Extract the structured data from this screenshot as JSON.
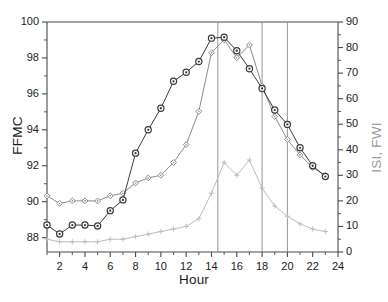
{
  "chart_data": {
    "type": "line",
    "title": "",
    "xlabel": "Hour",
    "ylabel": "FFMC",
    "ylabel_right": "ISI, FWI",
    "xlim": [
      1,
      24
    ],
    "ylim": [
      87.2,
      100
    ],
    "ylim_right": [
      0,
      90
    ],
    "grid": false,
    "legend_position": "none",
    "xticks": [
      2,
      4,
      6,
      8,
      10,
      12,
      14,
      16,
      18,
      20,
      22,
      24
    ],
    "xticks_minor": [
      1,
      3,
      5,
      7,
      9,
      11,
      13,
      15,
      17,
      19,
      21,
      23
    ],
    "yticks_left": [
      88,
      90,
      92,
      94,
      96,
      98,
      100
    ],
    "yticks_right": [
      0,
      10,
      20,
      30,
      40,
      50,
      60,
      70,
      80,
      90
    ],
    "vertical_reference_lines": [
      14.5,
      18,
      20
    ],
    "x": [
      1,
      2,
      3,
      4,
      5,
      6,
      7,
      8,
      9,
      10,
      11,
      12,
      13,
      14,
      15,
      16,
      17,
      18,
      19,
      20,
      21,
      22,
      23
    ],
    "series": [
      {
        "name": "FFMC",
        "axis": "left",
        "color": "#3a3a3a",
        "marker": "circle-dot",
        "values": [
          88.7,
          88.2,
          88.7,
          88.7,
          88.65,
          89.5,
          90.1,
          92.7,
          94.0,
          95.2,
          96.7,
          97.2,
          97.8,
          99.1,
          99.15,
          98.4,
          97.4,
          96.3,
          95.1,
          94.3,
          93.0,
          92.0,
          91.4
        ]
      },
      {
        "name": "FWI",
        "axis": "right",
        "color": "#8c8c8c",
        "marker": "diamond",
        "values": [
          22,
          19,
          20,
          20,
          20,
          22,
          23,
          27,
          29,
          30,
          35,
          42,
          55,
          78,
          83,
          76,
          81,
          65,
          53,
          44,
          38,
          33,
          30
        ]
      },
      {
        "name": "ISI",
        "axis": "right",
        "color": "#bdbdbd",
        "marker": "plus",
        "values": [
          5,
          4,
          4,
          4,
          4,
          5,
          5,
          6,
          7,
          8,
          9,
          10,
          13,
          23,
          35,
          30,
          36,
          25,
          18,
          14,
          11,
          9,
          8
        ]
      }
    ]
  },
  "axes": {
    "left_title": "FFMC",
    "right_title": "ISI, FWI",
    "x_title": "Hour"
  },
  "colors": {
    "ffmc": "#3a3a3a",
    "fwi": "#8c8c8c",
    "isi": "#bdbdbd",
    "axis": "#4a4a4a",
    "vline": "#8a8a8a"
  }
}
